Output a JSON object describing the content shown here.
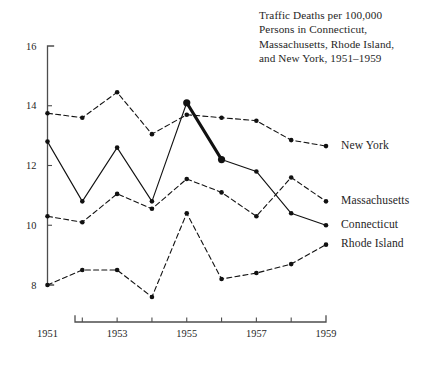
{
  "figure": {
    "title_lines": [
      "Traffic Deaths per 100,000",
      "Persons in Connecticut,",
      "Massachusetts, Rhode Island,",
      "and New York, 1951–1959"
    ]
  },
  "chart_data": {
    "type": "line",
    "xlabel": "",
    "ylabel": "",
    "x": [
      1951,
      1952,
      1953,
      1954,
      1955,
      1956,
      1957,
      1958,
      1959
    ],
    "xtick_labels": [
      "1951",
      "",
      "1953",
      "",
      "1955",
      "",
      "1957",
      "",
      "1959"
    ],
    "xlim": [
      1951,
      1959
    ],
    "ylim": [
      8,
      16
    ],
    "ytick_labels": [
      "8",
      "10",
      "12",
      "14",
      "16"
    ],
    "yticks": [
      8,
      10,
      12,
      14,
      16
    ],
    "grid": false,
    "legend": "right-end-labels",
    "series": [
      {
        "name": "New York",
        "style": "dashed",
        "label_y_value": 12.65,
        "values": [
          13.75,
          13.6,
          14.45,
          13.05,
          13.7,
          13.6,
          13.5,
          12.85,
          12.65
        ]
      },
      {
        "name": "Massachusetts",
        "style": "dashed",
        "label_y_value": 10.8,
        "values": [
          10.3,
          10.1,
          11.05,
          10.55,
          11.55,
          11.1,
          10.3,
          11.6,
          10.8
        ]
      },
      {
        "name": "Connecticut",
        "style": "solid",
        "label_y_value": 10.0,
        "highlight_segment": [
          1955,
          1956
        ],
        "values": [
          12.8,
          10.8,
          12.6,
          10.8,
          14.1,
          12.2,
          11.8,
          10.4,
          10.0
        ]
      },
      {
        "name": "Rhode Island",
        "style": "dashed",
        "label_y_value": 9.35,
        "values": [
          8.0,
          8.5,
          8.5,
          7.6,
          10.4,
          8.2,
          8.4,
          8.7,
          9.35
        ]
      }
    ],
    "annotations": [
      {
        "text": "Connecticut 1955–1956 segment emphasized with heavy line and enlarged markers"
      }
    ]
  },
  "series_labels": [
    {
      "name": "New York",
      "text": "New York"
    },
    {
      "name": "Massachusetts",
      "text": "Massachusetts"
    },
    {
      "name": "Connecticut",
      "text": "Connecticut"
    },
    {
      "name": "Rhode Island",
      "text": "Rhode Island"
    }
  ]
}
